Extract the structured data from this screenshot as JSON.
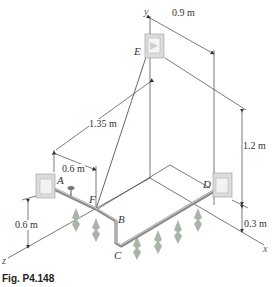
{
  "figure": {
    "caption": "Fig. P4.148",
    "axes": {
      "x": "x",
      "y": "y",
      "z": "z"
    },
    "points": {
      "A": "A",
      "B": "B",
      "C": "C",
      "D": "D",
      "E": "E",
      "F": "F"
    },
    "dimensions": {
      "ef_horizontal": "1.35 m",
      "e_offset": "0.9 m",
      "af": "0.6 m",
      "a_height": "0.6 m",
      "e_height": "1.2 m",
      "d_height": "0.3 m"
    },
    "colors": {
      "line": "#444444",
      "pipe": "#9a9a9a",
      "bracket": "#d8d8d8",
      "plant": "#8a9a8a"
    }
  }
}
